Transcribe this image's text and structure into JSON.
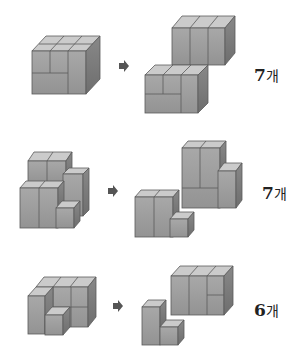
{
  "problems": [
    {
      "id": 1,
      "answer_number": "7",
      "answer_unit": "개"
    },
    {
      "id": 2,
      "answer_number": "7",
      "answer_unit": "개"
    },
    {
      "id": 3,
      "answer_number": "6",
      "answer_unit": "개"
    }
  ],
  "icons": {
    "arrow": "arrow-right-icon"
  },
  "colors": {
    "top": "#c9c9c9",
    "front": "#9e9e9e",
    "side": "#7d7d7d",
    "edge": "#5a5a5a",
    "arrow": "#555555"
  }
}
